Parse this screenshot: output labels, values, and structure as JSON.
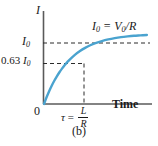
{
  "figure": {
    "caption": "(b)",
    "background_color": "#ffffff",
    "curve_color": "#4aa3cf",
    "axis_color": "#555555",
    "dash_color": "#333333",
    "text_color": "#1a1a1a"
  },
  "axes": {
    "y_axis_title": "I",
    "x_axis_title": "Time",
    "origin_label": "0",
    "y_ticks": [
      {
        "label_plain": "I0",
        "label_main": "I",
        "label_sub": "0",
        "value": 1.0
      },
      {
        "label_plain": "0.63 I0",
        "label_prefix": "0.63 ",
        "label_main": "I",
        "label_sub": "0",
        "value": 0.63
      }
    ],
    "x_ticks": [
      {
        "label_plain": "tau = L/R",
        "symbol": "τ",
        "equals": "=",
        "numerator": "L",
        "denominator": "R",
        "value": 1.0
      }
    ]
  },
  "annotations": [
    {
      "id": "asymptote-label",
      "text_plain": "I0 = V0/R",
      "part_a_main": "I",
      "part_a_sub": "0",
      "equals": " = ",
      "part_b_main": "V",
      "part_b_sub": "0",
      "part_c": "/R"
    }
  ],
  "chart_data": {
    "type": "line",
    "title": "(b)",
    "xlabel": "Time",
    "ylabel": "I",
    "xlim": [
      0,
      4.2
    ],
    "ylim": [
      0,
      1.18
    ],
    "grid": false,
    "legend": null,
    "series": [
      {
        "name": "I = I0(1 - e^(-t/tau))",
        "color": "#4aa3cf",
        "x": [
          0.0,
          0.1,
          0.2,
          0.3,
          0.4,
          0.5,
          0.6,
          0.7,
          0.8,
          0.9,
          1.0,
          1.2,
          1.4,
          1.6,
          1.8,
          2.0,
          2.25,
          2.5,
          2.75,
          3.0,
          3.25,
          3.5,
          3.75,
          4.0
        ],
        "y": [
          0.0,
          0.095,
          0.181,
          0.259,
          0.33,
          0.393,
          0.451,
          0.503,
          0.551,
          0.593,
          0.632,
          0.699,
          0.753,
          0.798,
          0.835,
          0.865,
          0.895,
          0.918,
          0.936,
          0.95,
          0.961,
          0.97,
          0.976,
          0.982
        ]
      }
    ],
    "reference_lines": [
      {
        "name": "asymptote",
        "orientation": "horizontal",
        "y": 1.0,
        "style": "dashed",
        "label": "I0 = V0/R"
      },
      {
        "name": "063-level",
        "orientation": "horizontal",
        "y": 0.63,
        "style": "dashed",
        "x_end": 1.0,
        "label": "0.63 I0"
      },
      {
        "name": "tau-marker",
        "orientation": "vertical",
        "x": 1.0,
        "style": "dashed",
        "y_end": 0.63,
        "label": "τ = L/R"
      }
    ]
  }
}
